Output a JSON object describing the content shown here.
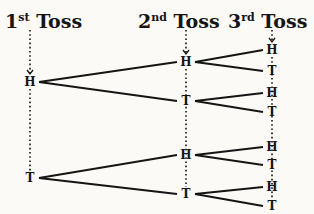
{
  "headers": [
    {
      "num": "1",
      "suffix": "st",
      "word": "Toss"
    },
    {
      "num": "2",
      "suffix": "nd",
      "word": "Toss"
    },
    {
      "num": "3",
      "suffix": "rd",
      "word": "Toss"
    }
  ],
  "tree": {
    "level1": [
      {
        "label": "H",
        "x": 30,
        "y": 82
      },
      {
        "label": "T",
        "x": 30,
        "y": 178
      }
    ],
    "level2": [
      {
        "label": "H",
        "x": 186,
        "y": 62,
        "parent": 0
      },
      {
        "label": "T",
        "x": 186,
        "y": 101,
        "parent": 0
      },
      {
        "label": "H",
        "x": 186,
        "y": 155,
        "parent": 1
      },
      {
        "label": "T",
        "x": 186,
        "y": 194,
        "parent": 1
      }
    ],
    "level3": [
      {
        "label": "H",
        "x": 272,
        "y": 50,
        "parent": 0
      },
      {
        "label": "T",
        "x": 272,
        "y": 71,
        "parent": 0
      },
      {
        "label": "H",
        "x": 272,
        "y": 93,
        "parent": 1
      },
      {
        "label": "T",
        "x": 272,
        "y": 112,
        "parent": 1
      },
      {
        "label": "H",
        "x": 272,
        "y": 147,
        "parent": 2
      },
      {
        "label": "T",
        "x": 272,
        "y": 165,
        "parent": 2
      },
      {
        "label": "H",
        "x": 272,
        "y": 187,
        "parent": 3
      },
      {
        "label": "T",
        "x": 272,
        "y": 206,
        "parent": 3
      }
    ]
  }
}
